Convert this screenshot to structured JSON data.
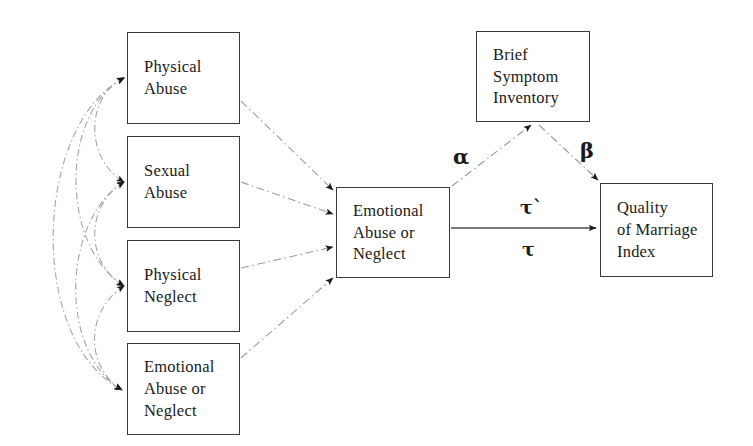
{
  "diagram": {
    "type": "path-diagram",
    "nodes": [
      {
        "id": "physical-abuse",
        "label": "Physical\nAbuse",
        "x": 127,
        "y": 32,
        "w": 113,
        "h": 92
      },
      {
        "id": "sexual-abuse",
        "label": "Sexual\nAbuse",
        "x": 127,
        "y": 136,
        "w": 113,
        "h": 92
      },
      {
        "id": "physical-neglect",
        "label": "Physical\nNeglect",
        "x": 127,
        "y": 240,
        "w": 113,
        "h": 92
      },
      {
        "id": "emotional-abuse-neglect-x",
        "label": "Emotional\nAbuse or\nNeglect",
        "x": 127,
        "y": 343,
        "w": 113,
        "h": 92
      },
      {
        "id": "emotional-abuse-neglect-m",
        "label": "Emotional\nAbuse or\nNeglect",
        "x": 336,
        "y": 187,
        "w": 114,
        "h": 91
      },
      {
        "id": "brief-symptom-inventory",
        "label": "Brief\nSymptom\nInventory",
        "x": 476,
        "y": 31,
        "w": 114,
        "h": 91
      },
      {
        "id": "quality-of-marriage-index",
        "label": "Quality\nof Marriage\nIndex",
        "x": 600,
        "y": 183,
        "w": 113,
        "h": 94
      }
    ],
    "path_labels": [
      {
        "id": "alpha",
        "text": "α",
        "x": 453,
        "y": 146,
        "size": "greek-lg"
      },
      {
        "id": "beta",
        "text": "β",
        "x": 580,
        "y": 140,
        "size": "greek-lg"
      },
      {
        "id": "tau-prime",
        "text": "τ`",
        "x": 520,
        "y": 198,
        "size": "greek-md"
      },
      {
        "id": "tau",
        "text": "τ",
        "x": 522,
        "y": 240,
        "size": "greek-md"
      }
    ],
    "colors": {
      "box_stroke": "#3a3a3a",
      "text": "#1a1a1a",
      "faint_edge": "#9a9a9a",
      "solid_edge": "#4a4a4a",
      "arrowhead": "#1a1a1a",
      "background": "#ffffff"
    },
    "edges": [
      {
        "id": "physical-abuse-to-mediator",
        "from": "physical-abuse",
        "to": "emotional-abuse-neglect-m",
        "style": "dash-dot",
        "arrow": "single"
      },
      {
        "id": "sexual-abuse-to-mediator",
        "from": "sexual-abuse",
        "to": "emotional-abuse-neglect-m",
        "style": "dash-dot",
        "arrow": "single"
      },
      {
        "id": "physical-neglect-to-mediator",
        "from": "physical-neglect",
        "to": "emotional-abuse-neglect-m",
        "style": "dash-dot",
        "arrow": "single"
      },
      {
        "id": "emotional-x-to-mediator",
        "from": "emotional-abuse-neglect-x",
        "to": "emotional-abuse-neglect-m",
        "style": "dash-dot",
        "arrow": "single"
      },
      {
        "id": "mediator-to-bsi-alpha",
        "from": "emotional-abuse-neglect-m",
        "to": "brief-symptom-inventory",
        "style": "dash-dot",
        "arrow": "single",
        "label": "alpha"
      },
      {
        "id": "bsi-to-qmi-beta",
        "from": "brief-symptom-inventory",
        "to": "quality-of-marriage-index",
        "style": "dash-dot",
        "arrow": "single",
        "label": "beta"
      },
      {
        "id": "mediator-to-qmi-direct",
        "from": "emotional-abuse-neglect-m",
        "to": "quality-of-marriage-index",
        "style": "solid",
        "arrow": "single",
        "label": "tau-prime / tau"
      },
      {
        "id": "corr-physical-abuse-sexual-abuse",
        "from": "physical-abuse",
        "to": "sexual-abuse",
        "style": "curve",
        "arrow": "double"
      },
      {
        "id": "corr-physical-abuse-physical-neglect",
        "from": "physical-abuse",
        "to": "physical-neglect",
        "style": "curve",
        "arrow": "double"
      },
      {
        "id": "corr-physical-abuse-emotional",
        "from": "physical-abuse",
        "to": "emotional-abuse-neglect-x",
        "style": "curve",
        "arrow": "double"
      },
      {
        "id": "corr-sexual-abuse-physical-neglect",
        "from": "sexual-abuse",
        "to": "physical-neglect",
        "style": "curve",
        "arrow": "double"
      },
      {
        "id": "corr-sexual-abuse-emotional",
        "from": "sexual-abuse",
        "to": "emotional-abuse-neglect-x",
        "style": "curve",
        "arrow": "double"
      },
      {
        "id": "corr-physical-neglect-emotional",
        "from": "physical-neglect",
        "to": "emotional-abuse-neglect-x",
        "style": "curve",
        "arrow": "double"
      }
    ]
  }
}
